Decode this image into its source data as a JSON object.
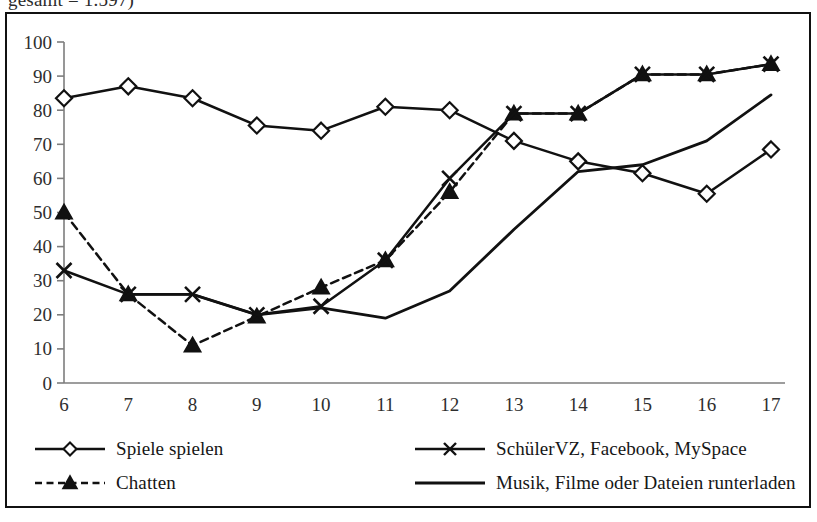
{
  "caption": {
    "text": "gesamt = 1.597)"
  },
  "chart_data": {
    "type": "line",
    "title": "",
    "subtitle": "",
    "xlabel": "",
    "ylabel": "",
    "x": [
      6,
      7,
      8,
      9,
      10,
      11,
      12,
      13,
      14,
      15,
      16,
      17
    ],
    "categories": [
      "6",
      "7",
      "8",
      "9",
      "10",
      "11",
      "12",
      "13",
      "14",
      "15",
      "16",
      "17"
    ],
    "xlim": [
      6,
      17
    ],
    "ylim": [
      0,
      100
    ],
    "yticks": [
      0,
      10,
      20,
      30,
      40,
      50,
      60,
      70,
      80,
      90,
      100
    ],
    "ytick_labels": [
      "0",
      "10",
      "20",
      "30",
      "40",
      "50",
      "60",
      "70",
      "80",
      "90",
      "100"
    ],
    "grid": false,
    "legend_position": "bottom",
    "series": [
      {
        "name": "Spiele spielen",
        "marker": "diamond-open",
        "line_style": "solid",
        "color": "#111111",
        "values": [
          83.5,
          87,
          83.5,
          75.5,
          74,
          81,
          80,
          71,
          65,
          61.5,
          55.5,
          68.5
        ]
      },
      {
        "name": "Chatten",
        "marker": "triangle-filled",
        "line_style": "dashed",
        "color": "#111111",
        "values": [
          50,
          26,
          11,
          19.5,
          28,
          36,
          56,
          79,
          79,
          90.5,
          90.5,
          93.5
        ]
      },
      {
        "name": "SchülerVZ, Facebook, MySpace",
        "marker": "x",
        "line_style": "solid",
        "color": "#111111",
        "values": [
          33,
          26,
          26,
          20,
          22.5,
          36,
          60,
          79,
          79,
          90.5,
          90.5,
          93.5
        ]
      },
      {
        "name": "Musik, Filme oder Dateien runterladen",
        "marker": "none",
        "line_style": "solid",
        "color": "#111111",
        "values": [
          null,
          26,
          26,
          20,
          22,
          19,
          27,
          45,
          62,
          64,
          71,
          84.5
        ]
      }
    ]
  },
  "legend": {
    "left": [
      {
        "label": "Spiele spielen",
        "marker": "diamond-open",
        "line_style": "solid"
      },
      {
        "label": "Chatten",
        "marker": "triangle-filled",
        "line_style": "dashed"
      }
    ],
    "right": [
      {
        "label": "SchülerVZ, Facebook, MySpace",
        "marker": "x",
        "line_style": "solid"
      },
      {
        "label": "Musik, Filme oder Dateien runterladen",
        "marker": "none",
        "line_style": "solid"
      }
    ]
  }
}
